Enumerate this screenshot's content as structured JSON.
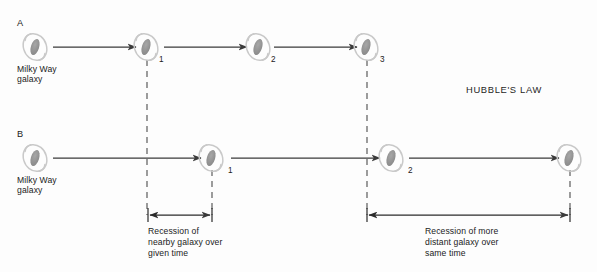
{
  "figure": {
    "title": "HUBBLE'S LAW",
    "canvas": {
      "width": 597,
      "height": 272
    },
    "colors": {
      "line": "#3a3a3a",
      "dashed": "#555555",
      "galaxy_core": "#8e8e8e",
      "galaxy_outline": "#c9c9c9",
      "text": "#1b1b1b",
      "background": "#fdfdfd"
    }
  },
  "rows": [
    {
      "letter": "A",
      "origin_label": "Milky Way\ngalaxy",
      "origin_label_line1": "Milky Way",
      "origin_label_line2": "galaxy",
      "galaxies": [
        {
          "number": "",
          "cx": 35,
          "cy": 47
        },
        {
          "number": "1",
          "cx": 146,
          "cy": 47
        },
        {
          "number": "2",
          "cx": 258,
          "cy": 47
        },
        {
          "number": "3",
          "cx": 366,
          "cy": 47
        }
      ],
      "arrows": [
        {
          "x1": 53,
          "x2": 136,
          "y": 47
        },
        {
          "x1": 164,
          "x2": 247,
          "y": 47
        },
        {
          "x1": 274,
          "x2": 357,
          "y": 47
        }
      ]
    },
    {
      "letter": "B",
      "origin_label_line1": "Milky Way",
      "origin_label_line2": "galaxy",
      "galaxies": [
        {
          "number": "",
          "cx": 35,
          "cy": 158
        },
        {
          "number": "1",
          "cx": 211,
          "cy": 158
        },
        {
          "number": "2",
          "cx": 391,
          "cy": 158
        },
        {
          "number": "",
          "cx": 569,
          "cy": 158
        }
      ],
      "arrows": [
        {
          "x1": 53,
          "x2": 201,
          "y": 158
        },
        {
          "x1": 231,
          "x2": 380,
          "y": 158
        },
        {
          "x1": 409,
          "x2": 559,
          "y": 158
        }
      ]
    }
  ],
  "dashed_lines": [
    {
      "name": "dash-a1",
      "x": 147,
      "y1": 60,
      "y2": 215
    },
    {
      "name": "dash-b1",
      "x": 212,
      "y1": 170,
      "y2": 215
    },
    {
      "name": "dash-a3",
      "x": 367,
      "y1": 60,
      "y2": 215
    },
    {
      "name": "dash-b3",
      "x": 570,
      "y1": 170,
      "y2": 215
    }
  ],
  "measurements": [
    {
      "name": "nearby-recession",
      "x1": 148,
      "x2": 212,
      "y": 215,
      "caption_line1": "Recession of",
      "caption_line2": "nearby galaxy over",
      "caption_line3": "given time",
      "caption_x": 148,
      "caption_y": 227
    },
    {
      "name": "distant-recession",
      "x1": 367,
      "x2": 570,
      "y": 215,
      "caption_line1": "Recession of more",
      "caption_line2": "distant galaxy over",
      "caption_line3": "same time",
      "caption_x": 425,
      "caption_y": 227
    }
  ]
}
